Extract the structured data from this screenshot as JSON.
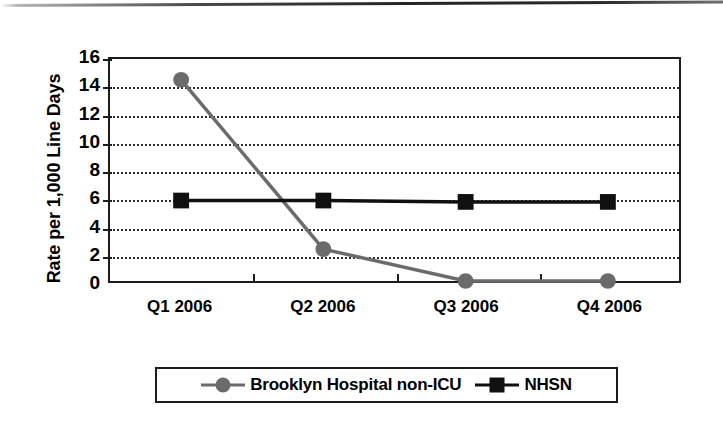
{
  "chart_data": {
    "type": "line",
    "title": "",
    "xlabel": "",
    "ylabel": "Rate per 1,000 Line Days",
    "categories": [
      "Q1 2006",
      "Q2 2006",
      "Q3 2006",
      "Q4 2006"
    ],
    "ylim": [
      0,
      16
    ],
    "yticks": [
      0,
      2,
      4,
      6,
      8,
      10,
      12,
      14,
      16
    ],
    "ytick_labels": [
      "0",
      "2",
      "4",
      "6",
      "8",
      "10",
      "12",
      "14",
      "16"
    ],
    "grid": "horizontal-dotted",
    "legend_position": "below-plot",
    "series": [
      {
        "name": "Brooklyn Hospital non-ICU",
        "values": [
          14.5,
          2.3,
          0.0,
          0.0
        ],
        "color": "#6b6b6b",
        "marker": "circle"
      },
      {
        "name": "NHSN",
        "values": [
          5.8,
          5.8,
          5.7,
          5.7
        ],
        "color": "#101010",
        "marker": "square"
      }
    ]
  },
  "axes": {
    "y_title": "Rate per 1,000 Line Days",
    "y_tick_labels": [
      "16",
      "14",
      "12",
      "10",
      "8",
      "6",
      "4",
      "2",
      "0"
    ],
    "x_tick_labels": [
      "Q1 2006",
      "Q2 2006",
      "Q3 2006",
      "Q4 2006"
    ]
  },
  "legend": {
    "entries": [
      {
        "label": "Brooklyn Hospital non-ICU",
        "marker": "circle-marker",
        "color": "#6b6b6b"
      },
      {
        "label": "NHSN",
        "marker": "square-marker",
        "color": "#101010"
      }
    ]
  },
  "colors": {
    "series_brooklyn": "#6b6b6b",
    "series_nhsn": "#101010",
    "axis": "#1c1c1c",
    "grid": "#2b2b2b",
    "background": "#ffffff"
  }
}
